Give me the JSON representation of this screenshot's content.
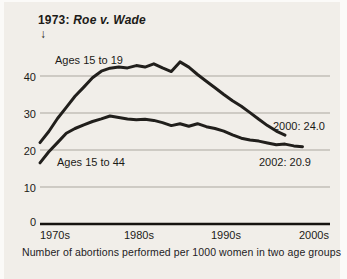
{
  "chart_data": {
    "type": "line",
    "title": "1973: Roe v. Wade",
    "caption": "Number of abortions performed per 1000 women in two age groups",
    "annotation": {
      "prefix": "1973:",
      "case": "Roe v. Wade",
      "arrow": "↓",
      "marks_year": 1973
    },
    "x_tick_labels": [
      "1970s",
      "1980s",
      "1990s",
      "2000s"
    ],
    "y_ticks": [
      0,
      10,
      20,
      30,
      40
    ],
    "ylim": [
      0,
      46
    ],
    "xlim_years": [
      1972,
      2003
    ],
    "grid": "horizontal-only",
    "legend_position": "inline-labels-on-lines",
    "colors": {
      "line": "#211f1c",
      "grid": "#aba79f",
      "axis": "#15130f",
      "background": "#f1eee9",
      "text": "#1c1a17"
    },
    "series": [
      {
        "name": "Ages 15 to 19",
        "label": "Ages 15 to 19",
        "end_annotation": "2000: 24.0",
        "end_year": 2000,
        "end_value": 24.0,
        "years": [
          1972,
          1973,
          1974,
          1975,
          1976,
          1977,
          1978,
          1979,
          1980,
          1981,
          1982,
          1983,
          1984,
          1985,
          1986,
          1987,
          1988,
          1989,
          1990,
          1991,
          1992,
          1993,
          1994,
          1995,
          1996,
          1997,
          1998,
          1999,
          2000
        ],
        "values": [
          22,
          25,
          28.5,
          31.5,
          34.5,
          37,
          39.5,
          41.3,
          42.1,
          42.4,
          42.2,
          42.8,
          42.4,
          43.3,
          42.2,
          41.2,
          43.8,
          42.4,
          40.4,
          38.6,
          36.8,
          35.0,
          33.3,
          31.8,
          30.1,
          28.3,
          26.6,
          25.1,
          24.0
        ]
      },
      {
        "name": "Ages 15 to 44",
        "label": "Ages 15 to 44",
        "end_annotation": "2002: 20.9",
        "end_year": 2002,
        "end_value": 20.9,
        "years": [
          1972,
          1973,
          1974,
          1975,
          1976,
          1977,
          1978,
          1979,
          1980,
          1981,
          1982,
          1983,
          1984,
          1985,
          1986,
          1987,
          1988,
          1989,
          1990,
          1991,
          1992,
          1993,
          1994,
          1995,
          1996,
          1997,
          1998,
          1999,
          2000,
          2001,
          2002
        ],
        "values": [
          16.5,
          19.5,
          22,
          24.5,
          25.8,
          26.8,
          27.7,
          28.4,
          29.2,
          28.8,
          28.4,
          28.2,
          28.3,
          28.0,
          27.4,
          26.6,
          27.1,
          26.4,
          27.1,
          26.3,
          25.8,
          25.1,
          24.1,
          23.2,
          22.7,
          22.4,
          21.9,
          21.4,
          21.6,
          21.1,
          20.9
        ]
      }
    ]
  }
}
